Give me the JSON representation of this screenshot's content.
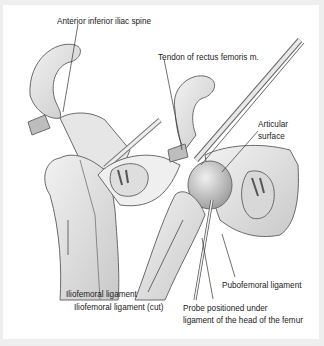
{
  "figure": {
    "labels": {
      "aiis": "Anterior inferior iliac spine",
      "tendon": "Tendon of rectus femoris m.",
      "articular_1": "Articular",
      "articular_2": "surface",
      "iliofemoral": "Iliofemoral ligament",
      "iliofemoral_cut": "Iliofemoral ligament (cut)",
      "pubofemoral": "Pubofemoral ligament",
      "probe_1": "Probe positioned under",
      "probe_2": "ligament of the head of the femur"
    },
    "colors": {
      "background": "#eeeeee",
      "panel": "#ffffff",
      "bone": "#e4e4e4",
      "bone_shadow": "#b8b8b8",
      "outline": "#6a6a6a",
      "text": "#222222"
    }
  }
}
